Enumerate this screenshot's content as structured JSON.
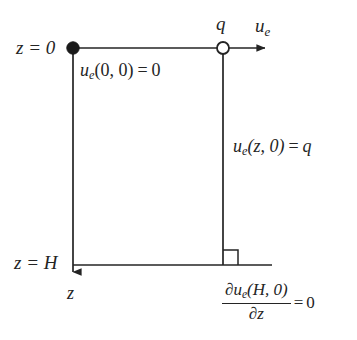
{
  "figure": {
    "type": "boundary-condition-schematic",
    "background_color": "#ffffff",
    "line_color": "#242424",
    "title": ""
  },
  "labels": {
    "z_top": "z = 0",
    "z_bottom": "z = H",
    "flux_q": "q",
    "ue_axis": "u",
    "ue_axis_sub": "e",
    "z_axis": "z"
  },
  "equations": {
    "top_boundary": {
      "fn": "u",
      "fn_sub": "e",
      "args": "(0, 0)",
      "rel": "=",
      "rhs": "0",
      "full": "u_e(0, 0) = 0"
    },
    "right_side": {
      "fn": "u",
      "fn_sub": "e",
      "args": "(z, 0)",
      "rel": "=",
      "rhs": "q",
      "full": "u_e(z, 0) = q"
    },
    "bottom_boundary": {
      "numerator_partial": "∂",
      "numerator_fn": "u",
      "numerator_sub": "e",
      "numerator_args": "(H, 0)",
      "denominator_partial": "∂",
      "denominator_var": "z",
      "rel": "=",
      "rhs": "0",
      "full": "∂u_e(H, 0)/∂z = 0"
    }
  },
  "markers": {
    "origin_node": "filled-circle",
    "drainage_node": "open-circle",
    "right_angle": "right-angle-square"
  },
  "geometry": {
    "left_x": 73,
    "right_x": 223,
    "top_y": 48,
    "bottom_y": 265,
    "arrow_tip_x": 272,
    "z_arrow_tip_y": 279
  }
}
